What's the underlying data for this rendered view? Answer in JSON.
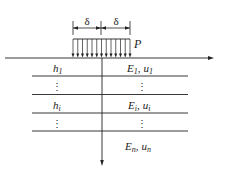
{
  "diagram": {
    "type": "layered elastic half-space under uniform strip load",
    "load": {
      "label": "P",
      "half_width_label": "δ",
      "arrow_count": 13
    },
    "dimension_labels": [
      "δ",
      "δ"
    ],
    "layers": [
      {
        "thickness": "h",
        "thickness_sub": "1",
        "modulus": "E",
        "modulus_sub": "1",
        "poisson": "u",
        "poisson_sub": "1"
      },
      {
        "thickness": "⋮",
        "modulus": "⋮"
      },
      {
        "thickness": "h",
        "thickness_sub": "i",
        "modulus": "E",
        "modulus_sub": "i",
        "poisson": "u",
        "poisson_sub": "i"
      },
      {
        "thickness": "⋮",
        "modulus": "⋮"
      },
      {
        "modulus": "E",
        "modulus_sub": "n",
        "poisson": "u",
        "poisson_sub": "n"
      }
    ],
    "separator": ","
  }
}
